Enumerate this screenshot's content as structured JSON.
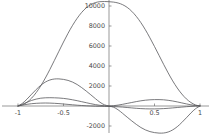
{
  "chart_data": {
    "type": "line",
    "title": "",
    "subtitle": "",
    "xlabel": "",
    "ylabel": "",
    "xlim": [
      -1,
      1
    ],
    "ylim": [
      -2800,
      10600
    ],
    "grid": false,
    "legend": null,
    "legend_position": "none",
    "background_color": "#ffffff",
    "curve_color": "#58585c",
    "axis_color": "#6f6f6f",
    "x_ticks": [
      -1,
      -0.5,
      0.5,
      1
    ],
    "x_tick_labels": [
      "-1",
      "-0.5",
      "0.5",
      "1"
    ],
    "y_ticks": [
      -2000,
      2000,
      4000,
      6000,
      8000,
      10000
    ],
    "y_tick_labels": [
      "-2000",
      "2000",
      "4000",
      "6000",
      "8000",
      "10000"
    ],
    "annotations": [],
    "series": [
      {
        "name": "curve-1",
        "description": "tall broad positive peak",
        "peak_x": 0.07,
        "peak_y": 10450,
        "x": [
          -1.0,
          -0.95,
          -0.9,
          -0.85,
          -0.8,
          -0.75,
          -0.7,
          -0.65,
          -0.6,
          -0.55,
          -0.5,
          -0.45,
          -0.4,
          -0.35,
          -0.3,
          -0.25,
          -0.2,
          -0.15,
          -0.1,
          -0.05,
          0.0,
          0.05,
          0.1,
          0.15,
          0.2,
          0.25,
          0.3,
          0.35,
          0.4,
          0.45,
          0.5,
          0.55,
          0.6,
          0.65,
          0.7,
          0.75,
          0.8,
          0.85,
          0.9,
          0.95,
          1.0
        ],
        "y": [
          0,
          120,
          380,
          790,
          1340,
          2010,
          2790,
          3650,
          4560,
          5480,
          6400,
          7270,
          8070,
          8770,
          9360,
          9820,
          10140,
          10340,
          10430,
          10450,
          10430,
          10390,
          10300,
          10130,
          9860,
          9470,
          8960,
          8340,
          7620,
          6810,
          5950,
          5060,
          4170,
          3310,
          2510,
          1800,
          1200,
          710,
          350,
          110,
          0
        ]
      },
      {
        "name": "curve-2",
        "description": "medium bump positive on left, negative trough on right",
        "peak_x": -0.45,
        "peak_y": 2700,
        "trough_x": 0.45,
        "trough_y": -2650,
        "x": [
          -1.0,
          -0.95,
          -0.9,
          -0.85,
          -0.8,
          -0.75,
          -0.7,
          -0.65,
          -0.6,
          -0.55,
          -0.5,
          -0.45,
          -0.4,
          -0.35,
          -0.3,
          -0.25,
          -0.2,
          -0.15,
          -0.1,
          -0.05,
          0.0,
          0.05,
          0.1,
          0.15,
          0.2,
          0.25,
          0.3,
          0.35,
          0.4,
          0.45,
          0.5,
          0.55,
          0.6,
          0.65,
          0.7,
          0.75,
          0.8,
          0.85,
          0.9,
          0.95,
          1.0
        ],
        "y": [
          0,
          280,
          700,
          1180,
          1650,
          2070,
          2390,
          2600,
          2700,
          2710,
          2660,
          2560,
          2390,
          2150,
          1840,
          1490,
          1120,
          740,
          380,
          120,
          0,
          -120,
          -380,
          -740,
          -1120,
          -1490,
          -1840,
          -2150,
          -2390,
          -2560,
          -2660,
          -2710,
          -2700,
          -2600,
          -2390,
          -2070,
          -1650,
          -1180,
          -700,
          -280,
          0
        ]
      },
      {
        "name": "curve-3",
        "description": "small flat positive bump on left, small positive bump on right",
        "peak_x": -0.5,
        "peak_y": 820,
        "secondary_peak_x": 0.55,
        "secondary_peak_y": 620,
        "x": [
          -1.0,
          -0.95,
          -0.9,
          -0.85,
          -0.8,
          -0.75,
          -0.7,
          -0.65,
          -0.6,
          -0.55,
          -0.5,
          -0.45,
          -0.4,
          -0.35,
          -0.3,
          -0.25,
          -0.2,
          -0.15,
          -0.1,
          -0.05,
          0.0,
          0.05,
          0.1,
          0.15,
          0.2,
          0.25,
          0.3,
          0.35,
          0.4,
          0.45,
          0.5,
          0.55,
          0.6,
          0.65,
          0.7,
          0.75,
          0.8,
          0.85,
          0.9,
          0.95,
          1.0
        ],
        "y": [
          0,
          180,
          380,
          560,
          690,
          780,
          820,
          830,
          820,
          800,
          760,
          700,
          620,
          530,
          430,
          330,
          230,
          140,
          70,
          20,
          0,
          30,
          90,
          170,
          260,
          350,
          440,
          520,
          580,
          620,
          640,
          640,
          620,
          570,
          500,
          410,
          310,
          210,
          120,
          50,
          0
        ]
      },
      {
        "name": "curve-4",
        "description": "very shallow near-zero wave crossing the axis",
        "x": [
          -1.0,
          -0.95,
          -0.9,
          -0.85,
          -0.8,
          -0.75,
          -0.7,
          -0.65,
          -0.6,
          -0.55,
          -0.5,
          -0.45,
          -0.4,
          -0.35,
          -0.3,
          -0.25,
          -0.2,
          -0.15,
          -0.1,
          -0.05,
          0.0,
          0.05,
          0.1,
          0.15,
          0.2,
          0.25,
          0.3,
          0.35,
          0.4,
          0.45,
          0.5,
          0.55,
          0.6,
          0.65,
          0.7,
          0.75,
          0.8,
          0.85,
          0.9,
          0.95,
          1.0
        ],
        "y": [
          0,
          90,
          170,
          230,
          270,
          290,
          300,
          290,
          270,
          240,
          200,
          160,
          120,
          80,
          50,
          20,
          0,
          -20,
          -30,
          -40,
          -50,
          -60,
          -80,
          -110,
          -150,
          -190,
          -230,
          -260,
          -280,
          -290,
          -290,
          -280,
          -260,
          -230,
          -190,
          -150,
          -110,
          -70,
          -40,
          -10,
          0
        ]
      }
    ]
  }
}
